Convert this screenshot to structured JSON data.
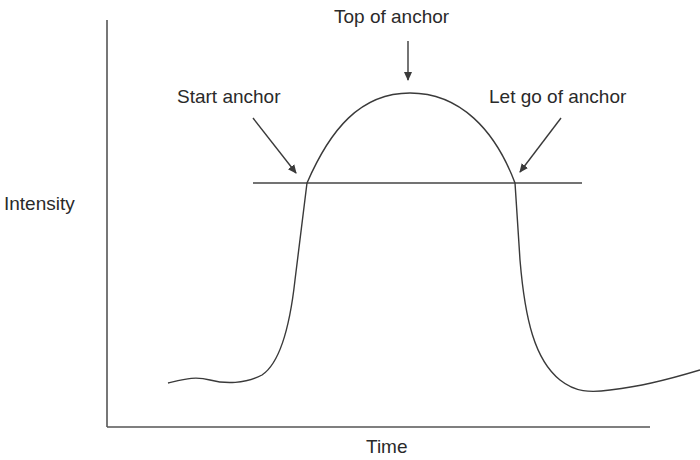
{
  "diagram": {
    "type": "intensity-over-time curve",
    "axes": {
      "xlabel": "Time",
      "ylabel": "Intensity"
    },
    "annotations": [
      {
        "id": "start",
        "label": "Start anchor"
      },
      {
        "id": "top",
        "label": "Top of anchor"
      },
      {
        "id": "letgo",
        "label": "Let go of anchor"
      }
    ],
    "colors": {
      "line": "#3a3a3a",
      "text": "#2a2a2a"
    }
  }
}
